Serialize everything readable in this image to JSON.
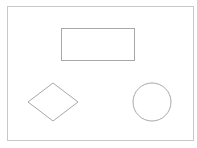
{
  "canvas": {
    "width": 197,
    "height": 148,
    "background": "#ffffff"
  },
  "colors": {
    "stroke": "#a8a8a8",
    "frame": "#c8c8c8"
  },
  "shapes": [
    {
      "type": "frame",
      "x": 7,
      "y": 6,
      "w": 186,
      "h": 134
    },
    {
      "type": "rectangle",
      "x": 61,
      "y": 28,
      "w": 73,
      "h": 32
    },
    {
      "type": "diamond",
      "cx": 53,
      "cy": 102,
      "rx": 25,
      "ry": 19
    },
    {
      "type": "circle",
      "cx": 152,
      "cy": 102,
      "r": 19
    }
  ]
}
